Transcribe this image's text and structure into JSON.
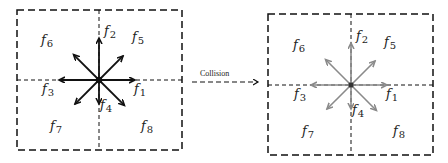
{
  "diagram": {
    "title": "",
    "transition_label": "Collision",
    "panels": [
      {
        "name": "before-collision",
        "arrow_color": "#111111",
        "vectors": [
          {
            "id": "f1",
            "letter": "f",
            "index": "1",
            "direction": "east"
          },
          {
            "id": "f2",
            "letter": "f",
            "index": "2",
            "direction": "north"
          },
          {
            "id": "f3",
            "letter": "f",
            "index": "3",
            "direction": "west"
          },
          {
            "id": "f4",
            "letter": "f",
            "index": "4",
            "direction": "south"
          },
          {
            "id": "f5",
            "letter": "f",
            "index": "5",
            "direction": "north-east"
          },
          {
            "id": "f6",
            "letter": "f",
            "index": "6",
            "direction": "north-west"
          },
          {
            "id": "f7",
            "letter": "f",
            "index": "7",
            "direction": "south-west"
          },
          {
            "id": "f8",
            "letter": "f",
            "index": "8",
            "direction": "south-east"
          }
        ]
      },
      {
        "name": "after-collision",
        "arrow_color": "#8a8a8a",
        "vectors": [
          {
            "id": "f1",
            "letter": "f",
            "index": "1",
            "direction": "east"
          },
          {
            "id": "f2",
            "letter": "f",
            "index": "2",
            "direction": "north"
          },
          {
            "id": "f3",
            "letter": "f",
            "index": "3",
            "direction": "west"
          },
          {
            "id": "f4",
            "letter": "f",
            "index": "4",
            "direction": "south"
          },
          {
            "id": "f5",
            "letter": "f",
            "index": "5",
            "direction": "north-east"
          },
          {
            "id": "f6",
            "letter": "f",
            "index": "6",
            "direction": "north-west"
          },
          {
            "id": "f7",
            "letter": "f",
            "index": "7",
            "direction": "south-west"
          },
          {
            "id": "f8",
            "letter": "f",
            "index": "8",
            "direction": "south-east"
          }
        ]
      }
    ]
  }
}
